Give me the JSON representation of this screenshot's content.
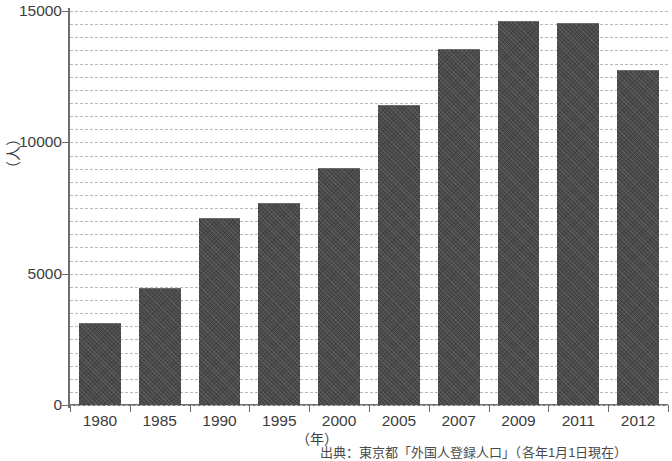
{
  "chart_data": {
    "type": "bar",
    "title": "",
    "subtitle": "",
    "xlabel": "（年）",
    "ylabel": "（人）",
    "categories": [
      "1980",
      "1985",
      "1990",
      "1995",
      "2000",
      "2005",
      "2007",
      "2009",
      "2011",
      "2012"
    ],
    "values": [
      3100,
      4400,
      7100,
      7650,
      9000,
      11400,
      13500,
      14600,
      14500,
      12700
    ],
    "ylim": [
      0,
      15000
    ],
    "ytick_labels": [
      "0",
      "5000",
      "10000",
      "15000"
    ],
    "ytick_values": [
      0,
      5000,
      10000,
      15000
    ],
    "grid": true,
    "grid_interval": 500,
    "grid_style": "dashed-horizontal",
    "legend": null,
    "legend_position": "none",
    "bar_color": "#4a4a4a",
    "grid_color": "#b9b9b9",
    "axis_color": "#6e6e6e",
    "annotations": [
      "出典：東京都「外国人登録人口」（各年1月1日現在）"
    ]
  },
  "figure": {
    "source_note": "出典：東京都「外国人登録人口」（各年1月1日現在）",
    "x_axis_title": "（年）",
    "y_axis_title": "（人）"
  }
}
